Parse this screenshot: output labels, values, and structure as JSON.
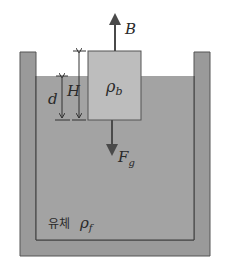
{
  "diagram": {
    "labels": {
      "buoyant_force": "B",
      "gravity_force_main": "F",
      "gravity_force_sub": "g",
      "block_density_main": "ρ",
      "block_density_sub": "b",
      "fluid_word": "유체",
      "fluid_density_main": "ρ",
      "fluid_density_sub": "f",
      "block_height": "H",
      "submerged_depth": "d"
    },
    "colors": {
      "container_wall": "#9a9a9a",
      "fluid": "#a3a3a3",
      "block": "#bdbdbd",
      "outline": "#3a3a3a",
      "arrow": "#4a4a4a",
      "background": "#ffffff"
    }
  }
}
